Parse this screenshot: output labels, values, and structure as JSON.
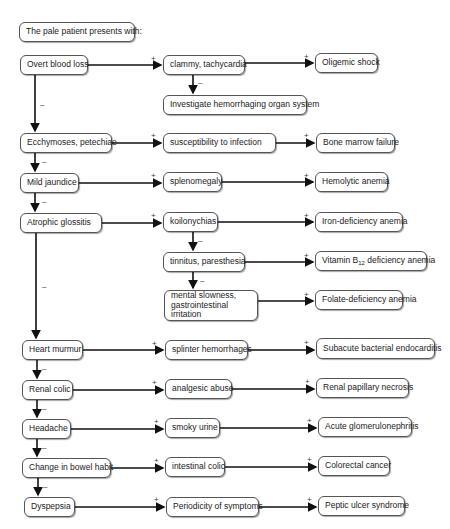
{
  "title": "The pale patient presents with:",
  "left_column": [
    {
      "id": "overt",
      "label": "Overt blood loss"
    },
    {
      "id": "ecchy",
      "label": "Ecchymoses, petechiae"
    },
    {
      "id": "jaundice",
      "label": "Mild jaundice"
    },
    {
      "id": "glossitis",
      "label": "Atrophic glossitis"
    },
    {
      "id": "murmur",
      "label": "Heart murmur"
    },
    {
      "id": "renal",
      "label": "Renal colic"
    },
    {
      "id": "headache",
      "label": "Headache"
    },
    {
      "id": "bowel",
      "label": "Change in bowel habit"
    },
    {
      "id": "dyspepsia",
      "label": "Dyspepsia"
    }
  ],
  "middle_column": [
    {
      "id": "clammy",
      "label": "clammy, tachycardia"
    },
    {
      "id": "investigate",
      "label": "Investigate hemorrhaging organ system"
    },
    {
      "id": "suscept",
      "label": "susceptibility to infection"
    },
    {
      "id": "spleno",
      "label": "splenomegaly"
    },
    {
      "id": "koilo",
      "label": "koilonychias"
    },
    {
      "id": "tinnitus",
      "label": "tinnitus, paresthesia"
    },
    {
      "id": "mental",
      "label": "mental slowness, gastrointestinal irritation"
    },
    {
      "id": "splinter",
      "label": "splinter hemorrhages"
    },
    {
      "id": "analgesic",
      "label": "analgesic abuse"
    },
    {
      "id": "smoky",
      "label": "smoky urine"
    },
    {
      "id": "colic",
      "label": "intestinal colic"
    },
    {
      "id": "periodicity",
      "label": "Periodicity of symptoms"
    }
  ],
  "right_column": [
    {
      "id": "oligemic",
      "label": "Oligemic shock"
    },
    {
      "id": "marrow",
      "label": "Bone marrow failure"
    },
    {
      "id": "hemolytic",
      "label": "Hemolytic anemia"
    },
    {
      "id": "iron",
      "label": "Iron-deficiency anemia"
    },
    {
      "id": "b12_pre",
      "label": "Vitamin B"
    },
    {
      "id": "b12_sub",
      "label": "12"
    },
    {
      "id": "b12_post",
      "label": " deficiency anemia"
    },
    {
      "id": "folate",
      "label": "Folate-deficiency anemia"
    },
    {
      "id": "sbe",
      "label": "Subacute bacterial endocarditis"
    },
    {
      "id": "papillary",
      "label": "Renal papillary necrosis"
    },
    {
      "id": "agn",
      "label": "Acute glomerulonephritis"
    },
    {
      "id": "crc",
      "label": "Colorectal cancer"
    },
    {
      "id": "pud",
      "label": "Peptic ulcer syndrome"
    }
  ],
  "edge_labels": {
    "positive": "+",
    "negative": "–"
  }
}
